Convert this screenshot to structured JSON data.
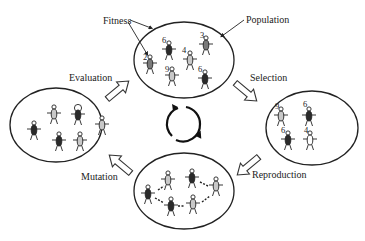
{
  "labels": {
    "fitness": "Fitness",
    "population": "Population",
    "evaluation": "Evaluation",
    "selection": "Selection",
    "reproduction": "Reproduction",
    "mutation": "Mutation"
  },
  "colors": {
    "dark": "#2a2a2a",
    "medium": "#7a7a7a",
    "light": "#c8c8c8",
    "white": "#ffffff"
  },
  "population": {
    "individuals": [
      {
        "fitness": "6",
        "shade": "dark"
      },
      {
        "fitness": "3",
        "shade": "medium"
      },
      {
        "fitness": "2",
        "shade": "medium"
      },
      {
        "fitness": "4",
        "shade": "light"
      },
      {
        "fitness": "9",
        "shade": "light"
      },
      {
        "fitness": "6",
        "shade": "dark"
      }
    ]
  },
  "selection": {
    "individuals": [
      {
        "fitness": "9",
        "shade": "light"
      },
      {
        "fitness": "6",
        "shade": "dark"
      },
      {
        "fitness": "6",
        "shade": "dark"
      },
      {
        "fitness": "4",
        "shade": "white"
      }
    ]
  },
  "evaluation": {
    "individuals": [
      {
        "shade": "light"
      },
      {
        "shade": "dark",
        "highlighted": true
      },
      {
        "shade": "dark"
      },
      {
        "shade": "light"
      },
      {
        "shade": "dark"
      },
      {
        "shade": "light"
      }
    ]
  },
  "reproduction": {
    "individuals": [
      {
        "shade": "light"
      },
      {
        "shade": "dark"
      },
      {
        "shade": "dark"
      },
      {
        "shade": "light"
      },
      {
        "shade": "dark"
      },
      {
        "shade": "light"
      }
    ]
  }
}
